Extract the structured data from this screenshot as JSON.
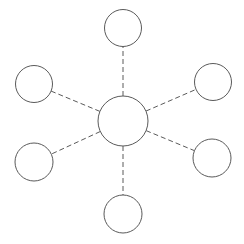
{
  "diagram": {
    "type": "star-network",
    "stroke_color": "#5a5a5a",
    "background": "#ffffff",
    "hub": {
      "id": "hub",
      "cx": 123,
      "cy": 121,
      "r": 25
    },
    "satellites": [
      {
        "id": "top",
        "cx": 123,
        "cy": 28,
        "r": 18.5
      },
      {
        "id": "upper-right",
        "cx": 213,
        "cy": 82,
        "r": 18.5
      },
      {
        "id": "lower-right",
        "cx": 212,
        "cy": 158,
        "r": 19
      },
      {
        "id": "bottom",
        "cx": 123,
        "cy": 214,
        "r": 19
      },
      {
        "id": "lower-left",
        "cx": 34,
        "cy": 162,
        "r": 19
      },
      {
        "id": "upper-left",
        "cx": 34,
        "cy": 84,
        "r": 18.5
      }
    ],
    "edge_style": "dashed"
  }
}
